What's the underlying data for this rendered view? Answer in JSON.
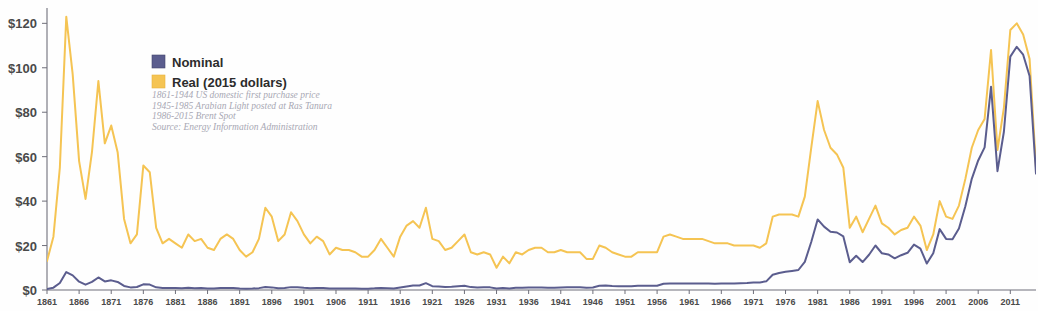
{
  "chart_data": {
    "type": "line",
    "title": "",
    "xlabel": "",
    "ylabel": "",
    "xlim": [
      1861,
      2015
    ],
    "ylim": [
      0,
      126
    ],
    "grid": false,
    "legend_position": "top-left",
    "y_ticks": [
      0,
      20,
      40,
      60,
      80,
      100,
      120
    ],
    "y_tick_labels": [
      "$0",
      "$20",
      "$40",
      "$60",
      "$80",
      "$100",
      "$120"
    ],
    "x_ticks": [
      1861,
      1866,
      1871,
      1876,
      1881,
      1886,
      1891,
      1896,
      1901,
      1906,
      1911,
      1916,
      1921,
      1926,
      1931,
      1936,
      1941,
      1946,
      1951,
      1956,
      1961,
      1966,
      1971,
      1976,
      1981,
      1986,
      1991,
      1996,
      2001,
      2006,
      2011
    ],
    "x_tick_labels": [
      "1861",
      "1866",
      "1871",
      "1876",
      "1881",
      "1886",
      "1891",
      "1896",
      "1901",
      "1906",
      "1911",
      "1916",
      "1921",
      "1926",
      "1931",
      "1936",
      "1941",
      "1946",
      "1951",
      "1956",
      "1961",
      "1966",
      "1971",
      "1976",
      "1981",
      "1986",
      "1991",
      "1996",
      "2001",
      "2006",
      "2011"
    ],
    "x": [
      1861,
      1862,
      1863,
      1864,
      1865,
      1866,
      1867,
      1868,
      1869,
      1870,
      1871,
      1872,
      1873,
      1874,
      1875,
      1876,
      1877,
      1878,
      1879,
      1880,
      1881,
      1882,
      1883,
      1884,
      1885,
      1886,
      1887,
      1888,
      1889,
      1890,
      1891,
      1892,
      1893,
      1894,
      1895,
      1896,
      1897,
      1898,
      1899,
      1900,
      1901,
      1902,
      1903,
      1904,
      1905,
      1906,
      1907,
      1908,
      1909,
      1910,
      1911,
      1912,
      1913,
      1914,
      1915,
      1916,
      1917,
      1918,
      1919,
      1920,
      1921,
      1922,
      1923,
      1924,
      1925,
      1926,
      1927,
      1928,
      1929,
      1930,
      1931,
      1932,
      1933,
      1934,
      1935,
      1936,
      1937,
      1938,
      1939,
      1940,
      1941,
      1942,
      1943,
      1944,
      1945,
      1946,
      1947,
      1948,
      1949,
      1950,
      1951,
      1952,
      1953,
      1954,
      1955,
      1956,
      1957,
      1958,
      1959,
      1960,
      1961,
      1962,
      1963,
      1964,
      1965,
      1966,
      1967,
      1968,
      1969,
      1970,
      1971,
      1972,
      1973,
      1974,
      1975,
      1976,
      1977,
      1978,
      1979,
      1980,
      1981,
      1982,
      1983,
      1984,
      1985,
      1986,
      1987,
      1988,
      1989,
      1990,
      1991,
      1992,
      1993,
      1994,
      1995,
      1996,
      1997,
      1998,
      1999,
      2000,
      2001,
      2002,
      2003,
      2004,
      2005,
      2006,
      2007,
      2008,
      2009,
      2010,
      2011,
      2012,
      2013,
      2014,
      2015
    ],
    "series": [
      {
        "name": "Nominal",
        "color": "#5b5d8e",
        "unit": "USD per barrel",
        "values": [
          0.49,
          1.05,
          3.15,
          8.06,
          6.59,
          3.74,
          2.41,
          3.63,
          5.64,
          3.86,
          4.34,
          3.64,
          1.83,
          1.17,
          1.35,
          2.56,
          2.42,
          1.19,
          0.86,
          0.95,
          0.86,
          0.78,
          1.0,
          0.84,
          0.88,
          0.71,
          0.67,
          0.88,
          0.94,
          0.87,
          0.67,
          0.56,
          0.64,
          0.84,
          1.36,
          1.18,
          0.79,
          0.91,
          1.29,
          1.19,
          0.96,
          0.8,
          0.94,
          0.86,
          0.62,
          0.73,
          0.72,
          0.72,
          0.7,
          0.61,
          0.61,
          0.74,
          0.95,
          0.81,
          0.64,
          1.1,
          1.56,
          1.98,
          2.01,
          3.07,
          1.73,
          1.61,
          1.34,
          1.43,
          1.68,
          1.88,
          1.3,
          1.17,
          1.27,
          1.19,
          0.65,
          0.87,
          0.67,
          1.0,
          0.97,
          1.09,
          1.18,
          1.13,
          1.02,
          1.02,
          1.14,
          1.19,
          1.2,
          1.21,
          1.05,
          1.12,
          1.9,
          1.99,
          1.78,
          1.71,
          1.71,
          1.71,
          1.93,
          1.93,
          1.93,
          1.93,
          2.79,
          2.97,
          2.9,
          2.88,
          2.89,
          2.9,
          2.89,
          2.88,
          2.86,
          2.88,
          2.92,
          2.94,
          3.09,
          3.18,
          3.39,
          3.39,
          3.89,
          6.87,
          7.67,
          8.19,
          8.57,
          9.0,
          12.64,
          21.59,
          31.77,
          28.52,
          26.19,
          25.88,
          24.09,
          12.51,
          15.4,
          12.58,
          15.86,
          20.03,
          16.54,
          15.99,
          14.25,
          15.66,
          16.75,
          20.46,
          18.64,
          11.91,
          16.56,
          27.39,
          23.0,
          22.81,
          27.69,
          37.66,
          50.04,
          58.3,
          64.2,
          91.48,
          53.48,
          71.21,
          105.01,
          109.45,
          105.87,
          96.29,
          52.39
        ]
      },
      {
        "name": "Real (2015 dollars)",
        "color": "#f5c453",
        "unit": "2015 USD per barrel",
        "values": [
          13.0,
          24.0,
          55.0,
          123.0,
          97.0,
          58.0,
          41.0,
          62.0,
          94.0,
          66.0,
          74.0,
          62.0,
          32.0,
          21.0,
          25.0,
          56.0,
          53.0,
          28.0,
          21.0,
          23.0,
          21.0,
          19.0,
          25.0,
          22.0,
          23.0,
          19.0,
          18.0,
          23.0,
          25.0,
          23.0,
          18.0,
          15.0,
          17.0,
          23.0,
          37.0,
          33.0,
          22.0,
          25.0,
          35.0,
          31.0,
          25.0,
          21.0,
          24.0,
          22.0,
          16.0,
          19.0,
          18.0,
          18.0,
          17.0,
          15.0,
          15.0,
          18.0,
          23.0,
          19.0,
          15.0,
          24.0,
          29.0,
          31.0,
          28.0,
          37.0,
          23.0,
          22.0,
          18.0,
          19.0,
          22.0,
          25.0,
          17.0,
          16.0,
          17.0,
          16.0,
          10.0,
          15.0,
          12.0,
          17.0,
          16.0,
          18.0,
          19.0,
          19.0,
          17.0,
          17.0,
          18.0,
          17.0,
          17.0,
          17.0,
          14.0,
          14.0,
          20.0,
          19.0,
          17.0,
          16.0,
          15.0,
          15.0,
          17.0,
          17.0,
          17.0,
          17.0,
          24.0,
          25.0,
          24.0,
          23.0,
          23.0,
          23.0,
          23.0,
          22.0,
          21.0,
          21.0,
          21.0,
          20.0,
          20.0,
          20.0,
          20.0,
          19.0,
          21.0,
          33.0,
          34.0,
          34.0,
          34.0,
          33.0,
          42.0,
          64.0,
          85.0,
          72.0,
          64.0,
          61.0,
          55.0,
          28.0,
          33.0,
          26.0,
          32.0,
          38.0,
          30.0,
          28.0,
          25.0,
          27.0,
          28.0,
          33.0,
          29.0,
          18.0,
          25.0,
          40.0,
          33.0,
          32.0,
          38.0,
          50.0,
          64.0,
          72.0,
          77.0,
          108.0,
          63.0,
          82.0,
          117.0,
          120.0,
          115.0,
          104.0,
          55.0
        ]
      }
    ],
    "annotations": [
      "1861-1944 US domestic first purchase price",
      "1945-1985 Arabian Light posted at Ras Tanura",
      "1986-2015 Brent Spot",
      "Source: Energy Information Administration"
    ],
    "colors": {
      "nominal": "#5b5d8e",
      "real": "#f5c453",
      "axis": "#6f6f7a",
      "tick_text": "#4a4a4a",
      "note_text": "#a8a8b4",
      "background": "#ffffff"
    }
  }
}
